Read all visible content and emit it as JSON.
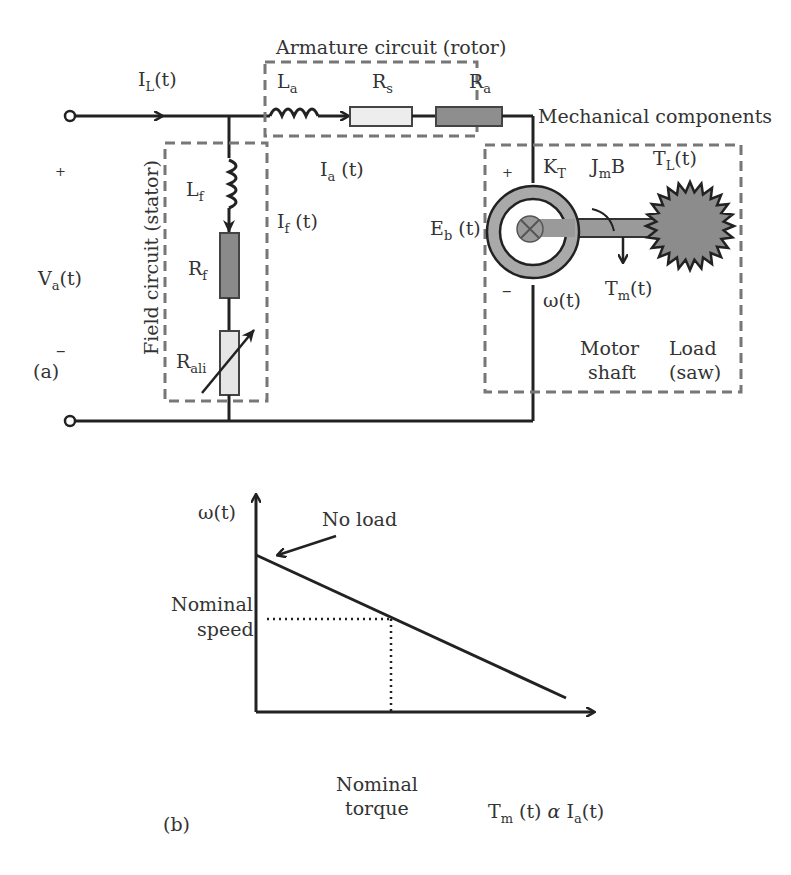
{
  "figure_a": {
    "panel_label": "(a)",
    "armature_box_title": "Armature circuit (rotor)",
    "mechanical_title": "Mechanical components",
    "field_box_title": "Field circuit (stator)",
    "labels": {
      "IL": {
        "main": "I",
        "sub": "L",
        "tail": "(t)"
      },
      "La": {
        "main": "L",
        "sub": "a"
      },
      "Rs": {
        "main": "R",
        "sub": "s"
      },
      "Ra": {
        "main": "R",
        "sub": "a"
      },
      "Ia": {
        "main": "I",
        "sub": "a",
        "tail": " (t)"
      },
      "Lf": {
        "main": "L",
        "sub": "f"
      },
      "If": {
        "main": "I",
        "sub": "f",
        "tail": " (t)"
      },
      "Rf": {
        "main": "R",
        "sub": "f"
      },
      "Rali": {
        "main": "R",
        "sub": "ali"
      },
      "Va": {
        "main": "V",
        "sub": "a",
        "tail": "(t)"
      },
      "plus_left": "+",
      "minus_left": "–",
      "plus_motor": "+",
      "minus_motor": "–",
      "Eb": {
        "main": "E",
        "sub": "b",
        "tail": " (t)"
      },
      "KT": {
        "main": "K",
        "sub": "T"
      },
      "JmB": {
        "main": "J",
        "sub": "m",
        "tail": "B"
      },
      "TL": {
        "main": "T",
        "sub": "L",
        "tail": "(t)"
      },
      "Tm": {
        "main": "T",
        "sub": "m",
        "tail": "(t)"
      },
      "omega": "ω(t)",
      "motor_shaft_1": "Motor",
      "motor_shaft_2": "shaft",
      "load_1": "Load",
      "load_2": "(saw)"
    },
    "colors": {
      "wire": "#222222",
      "dashed_box": "#777777",
      "resistor_dark": "#8a8a8a",
      "resistor_light": "#ececec",
      "saw": "#8c8c8c"
    }
  },
  "figure_b": {
    "panel_label": "(b)",
    "y_axis_label": "ω(t)",
    "x_axis_label": {
      "main": "T",
      "sub": "m",
      "mid": " (t) ",
      "alpha": "α",
      "main2": " I",
      "sub2": "a",
      "tail": "(t)"
    },
    "annotation": "No load",
    "nominal_speed_1": "Nominal",
    "nominal_speed_2": "speed",
    "nominal_torque_1": "Nominal",
    "nominal_torque_2": "torque"
  }
}
